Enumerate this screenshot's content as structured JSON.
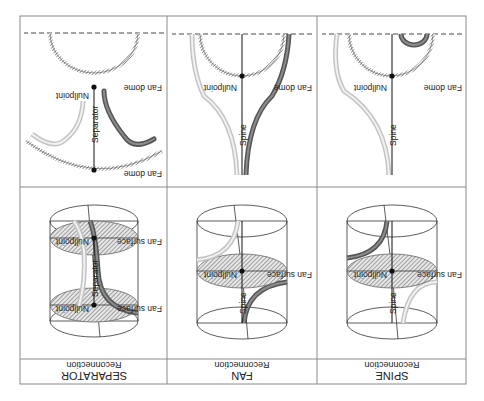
{
  "figure": {
    "orientation": "rotated-180",
    "columns": [
      {
        "id": "spine",
        "title": "SPINE",
        "subtitle": "Reconnection",
        "cylinder": {
          "fan_surface_label": "Fan surface",
          "nullpoint_label": "Nullpoint",
          "spine_label": "Spine"
        },
        "cross_section": {
          "fan_dome_label": "Fan dome",
          "nullpoint_label": "Nullpoint",
          "spine_label": "Spine"
        }
      },
      {
        "id": "fan",
        "title": "FAN",
        "subtitle": "Reconnection",
        "cylinder": {
          "fan_surface_label": "Fan surface",
          "nullpoint_label": "Nullpoint",
          "spine_label": "Spine"
        },
        "cross_section": {
          "fan_dome_label": "Fan dome",
          "nullpoint_label": "Nullpoint",
          "spine_label": "Spine"
        }
      },
      {
        "id": "separator",
        "title": "SEPARATOR",
        "subtitle": "Reconnection",
        "cylinder": {
          "fan_surface_top_label": "Fan surface",
          "fan_surface_bottom_label": "Fan surface",
          "nullpoint_top_label": "Nullpoint",
          "nullpoint_bottom_label": "Nullpoint",
          "separator_label": "Separator"
        },
        "cross_section": {
          "fan_dome_top_label": "Fan dome",
          "fan_dome_bottom_label": "Fan dome",
          "nullpoint_label": "Nullpoint",
          "separator_label": "Separator"
        }
      }
    ],
    "colors": {
      "border": "#8a8a8a",
      "line": "#222222",
      "dark_tube": "#555555",
      "dark_tube_core": "#8a8a8a",
      "light_tube": "#c8c8c8",
      "light_tube_core": "#f0f0f0",
      "hatch": "#555555"
    }
  }
}
